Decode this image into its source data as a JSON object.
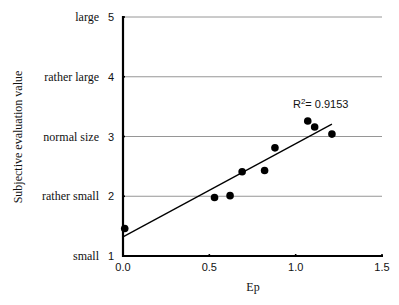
{
  "chart_data": {
    "type": "scatter",
    "title": "",
    "xlabel": "Ep",
    "ylabel": "Subjective evaluation value",
    "xlim": [
      0,
      1.5
    ],
    "ylim": [
      1,
      5
    ],
    "x_ticks": [
      {
        "value": 0.0,
        "label": "0.0"
      },
      {
        "value": 0.5,
        "label": "0.5"
      },
      {
        "value": 1.0,
        "label": "1.0"
      },
      {
        "value": 1.5,
        "label": "1.5"
      }
    ],
    "y_ticks": [
      {
        "value": 1,
        "label": "1",
        "category": "small"
      },
      {
        "value": 2,
        "label": "2",
        "category": "rather small"
      },
      {
        "value": 3,
        "label": "3",
        "category": "normal size"
      },
      {
        "value": 4,
        "label": "4",
        "category": "rather large"
      },
      {
        "value": 5,
        "label": "5",
        "category": "large"
      }
    ],
    "grid": "horizontal",
    "series": [
      {
        "name": "observations",
        "points": [
          {
            "x": 0.01,
            "y": 1.46
          },
          {
            "x": 0.53,
            "y": 1.98
          },
          {
            "x": 0.62,
            "y": 2.01
          },
          {
            "x": 0.69,
            "y": 2.41
          },
          {
            "x": 0.82,
            "y": 2.43
          },
          {
            "x": 0.88,
            "y": 2.81
          },
          {
            "x": 1.07,
            "y": 3.26
          },
          {
            "x": 1.11,
            "y": 3.16
          },
          {
            "x": 1.21,
            "y": 3.04
          }
        ]
      }
    ],
    "trendline": {
      "type": "linear",
      "x_range": [
        0.0,
        1.21
      ],
      "intercept": 1.32,
      "slope": 1.56
    },
    "annotations": [
      {
        "text_base": "R",
        "text_sup": "2",
        "text_rest": "= 0.9153",
        "x": 1.1,
        "y": 3.55
      }
    ]
  }
}
